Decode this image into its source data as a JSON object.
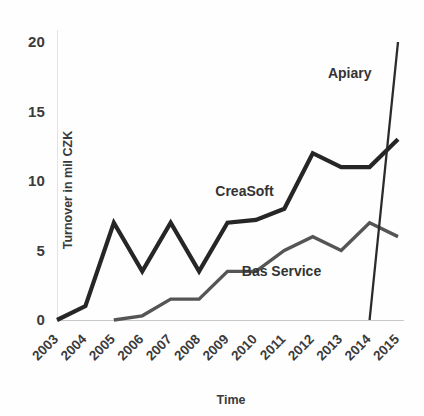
{
  "chart_data": {
    "type": "line",
    "title": "",
    "subtitle": "",
    "xlabel": "Time",
    "ylabel": "Turnover in mil CZK",
    "categories": [
      "2003",
      "2004",
      "2005",
      "2006",
      "2007",
      "2008",
      "2009",
      "2010",
      "2011",
      "2012",
      "2013",
      "2014",
      "2015"
    ],
    "x": [
      2003,
      2004,
      2005,
      2006,
      2007,
      2008,
      2009,
      2010,
      2011,
      2012,
      2013,
      2014,
      2015
    ],
    "ylim": [
      0,
      20
    ],
    "xlim": [
      2003,
      2015
    ],
    "yticks": [
      0,
      5,
      10,
      15,
      20
    ],
    "ytick_labels": [
      "0",
      "5",
      "10",
      "15",
      "20"
    ],
    "grid": false,
    "legend": "inline-annotations",
    "legend_position": "inside-plot",
    "series": [
      {
        "name": "CreaSoft",
        "color": "#262626",
        "stroke_width": 4.2,
        "label_x": 2009.6,
        "label_y": 8.9,
        "values": [
          0,
          1,
          7,
          3.5,
          7,
          3.5,
          7,
          7.2,
          8,
          12,
          11,
          11,
          13
        ]
      },
      {
        "name": "Bas Service",
        "color": "#555555",
        "stroke_width": 3.4,
        "label_x": 2010.9,
        "label_y": 3.2,
        "values": [
          null,
          null,
          0,
          0.3,
          1.5,
          1.5,
          3.5,
          3.5,
          5,
          6,
          5,
          7,
          6
        ]
      },
      {
        "name": "Apiary",
        "color": "#2b2b2b",
        "stroke_width": 2.3,
        "label_x": 2013.3,
        "label_y": 17.4,
        "values": [
          null,
          null,
          null,
          null,
          null,
          null,
          null,
          null,
          null,
          null,
          null,
          0,
          20
        ]
      }
    ],
    "annotations": [
      {
        "text": "CreaSoft",
        "series": "CreaSoft"
      },
      {
        "text": "Bas Service",
        "series": "Bas Service"
      },
      {
        "text": "Apiary",
        "series": "Apiary"
      }
    ]
  },
  "axes": {
    "y_axis_title": "Turnover in mil CZK",
    "x_axis_title": "Time",
    "y_tick_0": "0",
    "y_tick_1": "5",
    "y_tick_2": "10",
    "y_tick_3": "15",
    "y_tick_4": "20",
    "x_tick_0": "2003",
    "x_tick_1": "2004",
    "x_tick_2": "2005",
    "x_tick_3": "2006",
    "x_tick_4": "2007",
    "x_tick_5": "2008",
    "x_tick_6": "2009",
    "x_tick_7": "2010",
    "x_tick_8": "2011",
    "x_tick_9": "2012",
    "x_tick_10": "2013",
    "x_tick_11": "2014",
    "x_tick_12": "2015"
  },
  "labels": {
    "creasoft": "CreaSoft",
    "bas_service": "Bas Service",
    "apiary": "Apiary"
  },
  "colors": {
    "background": "#fefefe",
    "creasoft": "#262626",
    "bas_service": "#555555",
    "apiary": "#2b2b2b",
    "axis": "#c9c9c9",
    "text": "#3b3b3b"
  }
}
